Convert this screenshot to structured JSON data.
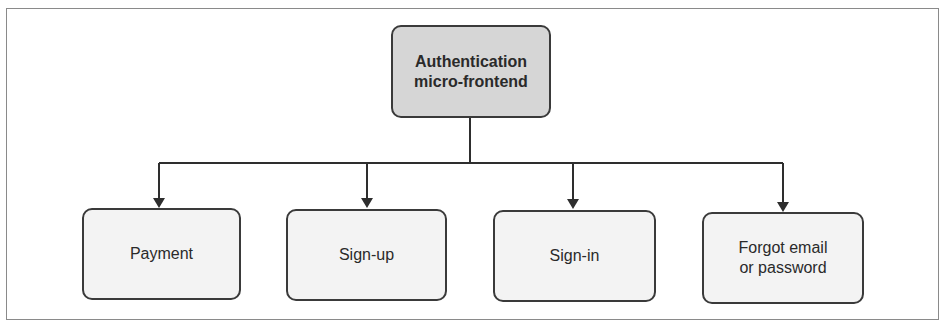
{
  "diagram": {
    "root": {
      "label": "Authentication\nmicro-frontend",
      "fill": "#d6d6d6"
    },
    "children": [
      {
        "label": "Payment"
      },
      {
        "label": "Sign-up"
      },
      {
        "label": "Sign-in"
      },
      {
        "label": "Forgot email\nor password"
      }
    ],
    "colors": {
      "stroke": "#3a3a3a",
      "child_fill": "#f3f3f3",
      "frame": "#8a8a8a"
    }
  }
}
